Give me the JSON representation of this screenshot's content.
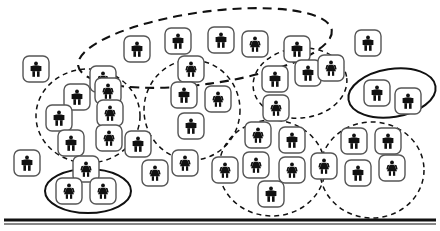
{
  "figure": {
    "type": "cluster-diagram",
    "background_color": "#ffffff",
    "icon_color": "#111111",
    "tile_border_color": "#555555",
    "tile_fill_color": "#ffffff",
    "cluster_stroke_color": "#111111",
    "baseline_color": "#111111",
    "width": 440,
    "height": 231
  },
  "baseline": {
    "name": "bottom-rule",
    "y": 220,
    "x1": 4,
    "x2": 436,
    "thickness": 3,
    "style": "double-solid"
  },
  "clusters": [
    {
      "id": "c1",
      "label": "top-band-cluster",
      "style": "dashed",
      "dash": "9 6",
      "cx": 205,
      "cy": 48,
      "rx": 128,
      "ry": 36,
      "rot": -8,
      "stroke_width": 2.1
    },
    {
      "id": "c2",
      "label": "left-cluster",
      "style": "dashed",
      "dash": "5 4",
      "cx": 88,
      "cy": 116,
      "rx": 52,
      "ry": 47,
      "rot": 0,
      "stroke_width": 1.5
    },
    {
      "id": "c3",
      "label": "center-left-cluster",
      "style": "dashed",
      "dash": "5 4",
      "cx": 192,
      "cy": 110,
      "rx": 48,
      "ry": 50,
      "rot": 0,
      "stroke_width": 1.5
    },
    {
      "id": "c4",
      "label": "center-right-cluster",
      "style": "dashed",
      "dash": "5 4",
      "cx": 300,
      "cy": 83,
      "rx": 47,
      "ry": 35,
      "rot": -6,
      "stroke_width": 1.5
    },
    {
      "id": "c5",
      "label": "lower-center-cluster",
      "style": "dashed",
      "dash": "5 4",
      "cx": 272,
      "cy": 168,
      "rx": 53,
      "ry": 48,
      "rot": 0,
      "stroke_width": 1.5
    },
    {
      "id": "c6",
      "label": "lower-right-cluster",
      "style": "dashed",
      "dash": "5 4",
      "cx": 372,
      "cy": 170,
      "rx": 52,
      "ry": 48,
      "rot": 0,
      "stroke_width": 1.5
    },
    {
      "id": "c7",
      "label": "pair-cluster-left",
      "style": "solid",
      "dash": "",
      "cx": 88,
      "cy": 191,
      "rx": 43,
      "ry": 22,
      "rot": 0,
      "stroke_width": 2.0
    },
    {
      "id": "c8",
      "label": "pair-cluster-right",
      "style": "solid",
      "dash": "",
      "cx": 392,
      "cy": 93,
      "rx": 44,
      "ry": 24,
      "rot": -9,
      "stroke_width": 2.0
    }
  ],
  "persons": [
    {
      "id": "p01",
      "x": 23,
      "y": 56,
      "gender": "male",
      "cluster": null
    },
    {
      "id": "p02",
      "x": 14,
      "y": 150,
      "gender": "male",
      "cluster": null
    },
    {
      "id": "p03",
      "x": 355,
      "y": 30,
      "gender": "male",
      "cluster": null
    },
    {
      "id": "p04",
      "x": 124,
      "y": 36,
      "gender": "male",
      "cluster": "c1"
    },
    {
      "id": "p05",
      "x": 165,
      "y": 28,
      "gender": "male",
      "cluster": "c1"
    },
    {
      "id": "p06",
      "x": 208,
      "y": 27,
      "gender": "male",
      "cluster": "c1"
    },
    {
      "id": "p07",
      "x": 242,
      "y": 31,
      "gender": "female",
      "cluster": "c1"
    },
    {
      "id": "p08",
      "x": 284,
      "y": 36,
      "gender": "male",
      "cluster": "c1"
    },
    {
      "id": "p09",
      "x": 178,
      "y": 56,
      "gender": "female",
      "cluster": "c1"
    },
    {
      "id": "p10",
      "x": 90,
      "y": 66,
      "gender": "female",
      "cluster": "c1"
    },
    {
      "id": "p11",
      "x": 64,
      "y": 84,
      "gender": "male",
      "cluster": "c2"
    },
    {
      "id": "p12",
      "x": 95,
      "y": 78,
      "gender": "female",
      "cluster": "c2"
    },
    {
      "id": "p13",
      "x": 46,
      "y": 105,
      "gender": "male",
      "cluster": "c2"
    },
    {
      "id": "p14",
      "x": 97,
      "y": 100,
      "gender": "female",
      "cluster": "c2"
    },
    {
      "id": "p15",
      "x": 58,
      "y": 130,
      "gender": "male",
      "cluster": "c2"
    },
    {
      "id": "p16",
      "x": 96,
      "y": 125,
      "gender": "female",
      "cluster": "c2"
    },
    {
      "id": "p17",
      "x": 73,
      "y": 156,
      "gender": "female",
      "cluster": "c2"
    },
    {
      "id": "p18",
      "x": 171,
      "y": 82,
      "gender": "male",
      "cluster": "c3"
    },
    {
      "id": "p19",
      "x": 205,
      "y": 86,
      "gender": "female",
      "cluster": "c3"
    },
    {
      "id": "p20",
      "x": 178,
      "y": 113,
      "gender": "male",
      "cluster": "c3"
    },
    {
      "id": "p21",
      "x": 172,
      "y": 150,
      "gender": "female",
      "cluster": "c3"
    },
    {
      "id": "p22",
      "x": 125,
      "y": 131,
      "gender": "male",
      "cluster": "c3"
    },
    {
      "id": "p23",
      "x": 142,
      "y": 160,
      "gender": "female",
      "cluster": "c3"
    },
    {
      "id": "p24",
      "x": 262,
      "y": 66,
      "gender": "male",
      "cluster": "c4"
    },
    {
      "id": "p25",
      "x": 295,
      "y": 60,
      "gender": "male",
      "cluster": "c4"
    },
    {
      "id": "p26",
      "x": 318,
      "y": 55,
      "gender": "female",
      "cluster": "c4"
    },
    {
      "id": "p27",
      "x": 263,
      "y": 95,
      "gender": "female",
      "cluster": "c4"
    },
    {
      "id": "p28",
      "x": 245,
      "y": 122,
      "gender": "female",
      "cluster": "c5"
    },
    {
      "id": "p29",
      "x": 279,
      "y": 127,
      "gender": "male",
      "cluster": "c5"
    },
    {
      "id": "p30",
      "x": 243,
      "y": 152,
      "gender": "female",
      "cluster": "c5"
    },
    {
      "id": "p31",
      "x": 279,
      "y": 157,
      "gender": "female",
      "cluster": "c5"
    },
    {
      "id": "p32",
      "x": 258,
      "y": 181,
      "gender": "male",
      "cluster": "c5"
    },
    {
      "id": "p33",
      "x": 212,
      "y": 157,
      "gender": "female",
      "cluster": "c5"
    },
    {
      "id": "p34",
      "x": 341,
      "y": 128,
      "gender": "male",
      "cluster": "c6"
    },
    {
      "id": "p35",
      "x": 375,
      "y": 128,
      "gender": "male",
      "cluster": "c6"
    },
    {
      "id": "p36",
      "x": 345,
      "y": 160,
      "gender": "male",
      "cluster": "c6"
    },
    {
      "id": "p37",
      "x": 379,
      "y": 155,
      "gender": "female",
      "cluster": "c6"
    },
    {
      "id": "p38",
      "x": 311,
      "y": 153,
      "gender": "female",
      "cluster": "c6"
    },
    {
      "id": "p39",
      "x": 56,
      "y": 178,
      "gender": "female",
      "cluster": "c7"
    },
    {
      "id": "p40",
      "x": 90,
      "y": 178,
      "gender": "female",
      "cluster": "c7"
    },
    {
      "id": "p41",
      "x": 364,
      "y": 80,
      "gender": "male",
      "cluster": "c8"
    },
    {
      "id": "p42",
      "x": 395,
      "y": 88,
      "gender": "male",
      "cluster": "c8"
    }
  ],
  "icon_metrics": {
    "tile_size": 26,
    "tile_radius": 6,
    "tile_stroke": 1.4
  }
}
